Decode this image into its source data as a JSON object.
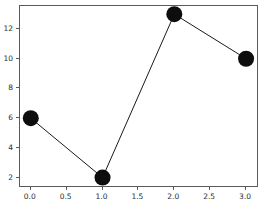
{
  "chart_data": {
    "type": "line",
    "title": "",
    "subtitle": "",
    "xlabel": "",
    "ylabel": "",
    "x": [
      0,
      1,
      2,
      3
    ],
    "values": [
      6,
      2,
      13,
      10
    ],
    "series": [
      {
        "name": "series-1",
        "x": [
          0,
          1,
          2,
          3
        ],
        "values": [
          6,
          2,
          13,
          10
        ]
      }
    ],
    "xlim": [
      -0.15,
      3.18
    ],
    "ylim": [
      1.3,
      13.55
    ],
    "xticks": [
      0.0,
      0.5,
      1.0,
      1.5,
      2.0,
      2.5,
      3.0
    ],
    "xticklabels": [
      "0.0",
      "0.5",
      "1.0",
      "1.5",
      "2.0",
      "2.5",
      "3.0"
    ],
    "yticks": [
      2,
      4,
      6,
      8,
      10,
      12
    ],
    "yticklabels": [
      "2",
      "4",
      "6",
      "8",
      "10",
      "12"
    ],
    "grid": false,
    "legend": null,
    "legend_position": "none",
    "annotations": [],
    "style": {
      "line_color": "#1a1a1a",
      "line_width": 1,
      "marker": "circle",
      "marker_color": "#0d0d0d",
      "marker_size": 16,
      "background_color": "#ffffff",
      "axes_background_color": "#ffffff",
      "spine_color": "#5a5a5a",
      "tick_label_color": "#2b2b2b"
    }
  }
}
